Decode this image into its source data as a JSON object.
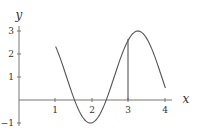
{
  "chart_data": {
    "type": "line",
    "title": "",
    "xlabel": "x",
    "ylabel": "y",
    "xlim": [
      0,
      4.2
    ],
    "ylim": [
      -1,
      3.2
    ],
    "x_ticks": [
      "1",
      "2",
      "3",
      "4"
    ],
    "y_ticks": [
      "-1",
      "1",
      "2",
      "3"
    ],
    "grid": false,
    "legend": null,
    "series": [
      {
        "name": "f(x)",
        "x": [
          1.0,
          1.25,
          1.5,
          1.55,
          1.75,
          1.95,
          2.2,
          2.4,
          2.6,
          2.8,
          3.0,
          3.25,
          3.5,
          3.75,
          4.0
        ],
        "y": [
          2.33,
          1.54,
          0.19,
          0.0,
          -0.77,
          -1.0,
          -0.55,
          0.0,
          1.0,
          2.05,
          2.64,
          3.0,
          2.55,
          1.61,
          0.52
        ]
      }
    ],
    "annotations": [
      {
        "type": "vertical-segment",
        "x": 3,
        "y_from": 0,
        "y_to": 2.64
      }
    ]
  },
  "labels": {
    "x_axis": "x",
    "y_axis": "y",
    "xticks": [
      "1",
      "2",
      "3",
      "4"
    ],
    "yticks": [
      "3",
      "2",
      "1",
      "−1"
    ]
  }
}
